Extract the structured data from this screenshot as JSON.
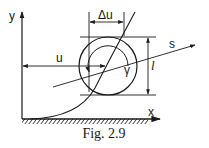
{
  "figure": {
    "caption": "Fig. 2.9",
    "labels": {
      "y_axis": "y",
      "x_axis": "x",
      "u": "u",
      "delta_u": "Δu",
      "s": "s",
      "l": "l",
      "gamma": "γ"
    }
  },
  "colors": {
    "ink": "#1a1a1a",
    "background": "#ffffff"
  }
}
